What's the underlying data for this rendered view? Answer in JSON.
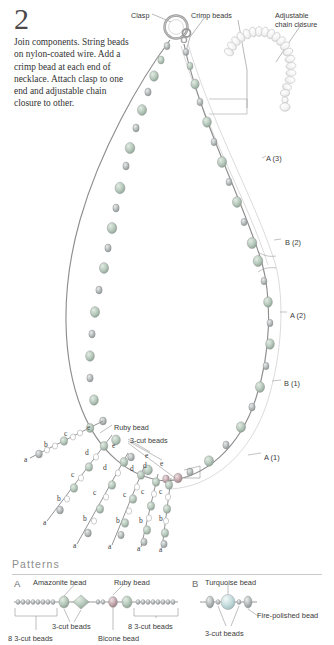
{
  "step": {
    "number": "2",
    "instruction": "Join components. String beads on nylon-coated wire. Add a crimp bead at each end of necklace. Attach clasp to one end and adjustable chain closure to other."
  },
  "diagram": {
    "callouts": [
      {
        "name": "clasp",
        "text": "Clasp",
        "x": 131,
        "y": 11
      },
      {
        "name": "crimp-beads",
        "text": "Crimp beads",
        "x": 191,
        "y": 11
      },
      {
        "name": "adjustable-chain-closure",
        "text": "Adjustable\nchain closure",
        "x": 275,
        "y": 11
      },
      {
        "name": "ruby-bead",
        "text": "Ruby bead",
        "x": 114,
        "y": 423
      },
      {
        "name": "three-cut-beads",
        "text": "3-cut beads",
        "x": 130,
        "y": 436
      }
    ],
    "segment_labels": [
      {
        "name": "segment-a3",
        "text": "A (3)",
        "x": 266,
        "y": 154
      },
      {
        "name": "segment-b2",
        "text": "B (2)",
        "x": 285,
        "y": 238
      },
      {
        "name": "segment-a2",
        "text": "A (2)",
        "x": 290,
        "y": 311
      },
      {
        "name": "segment-b1",
        "text": "B (1)",
        "x": 284,
        "y": 379
      },
      {
        "name": "segment-a1",
        "text": "A (1)",
        "x": 264,
        "y": 453
      }
    ],
    "dangles": [
      {
        "name": "dangle-1",
        "letters": [
          {
            "t": "a",
            "x": 24,
            "y": 455
          },
          {
            "t": "b",
            "x": 44,
            "y": 440
          },
          {
            "t": "c",
            "x": 64,
            "y": 429
          },
          {
            "t": "e",
            "x": 87,
            "y": 423
          }
        ]
      },
      {
        "name": "dangle-2",
        "letters": [
          {
            "t": "a",
            "x": 43,
            "y": 518
          },
          {
            "t": "b",
            "x": 57,
            "y": 494
          },
          {
            "t": "c",
            "x": 71,
            "y": 470
          },
          {
            "t": "d",
            "x": 85,
            "y": 448
          }
        ]
      },
      {
        "name": "dangle-3",
        "letters": [
          {
            "t": "a",
            "x": 73,
            "y": 541
          },
          {
            "t": "b",
            "x": 83,
            "y": 514
          },
          {
            "t": "c",
            "x": 93,
            "y": 488
          },
          {
            "t": "d",
            "x": 103,
            "y": 463
          },
          {
            "t": "e",
            "x": 112,
            "y": 441
          }
        ]
      },
      {
        "name": "dangle-4",
        "letters": [
          {
            "t": "a",
            "x": 108,
            "y": 542
          },
          {
            "t": "b",
            "x": 116,
            "y": 516
          },
          {
            "t": "c",
            "x": 123,
            "y": 490
          },
          {
            "t": "d",
            "x": 130,
            "y": 464
          }
        ]
      },
      {
        "name": "dangle-5",
        "letters": [
          {
            "t": "a",
            "x": 137,
            "y": 544
          },
          {
            "t": "b",
            "x": 139,
            "y": 516
          },
          {
            "t": "c",
            "x": 141,
            "y": 487
          },
          {
            "t": "d",
            "x": 143,
            "y": 461
          },
          {
            "t": "e",
            "x": 145,
            "y": 451
          }
        ]
      },
      {
        "name": "dangle-6",
        "letters": [
          {
            "t": "a",
            "x": 159,
            "y": 545
          },
          {
            "t": "b",
            "x": 159,
            "y": 514
          },
          {
            "t": "c",
            "x": 159,
            "y": 487
          },
          {
            "t": "e",
            "x": 160,
            "y": 459
          }
        ]
      }
    ]
  },
  "patterns": {
    "title": "Patterns",
    "a": {
      "letter": "A",
      "labels": [
        {
          "name": "amazonite-bead",
          "text": "Amazonite bead",
          "x": 33,
          "y": 578
        },
        {
          "name": "ruby-bead",
          "text": "Ruby bead",
          "x": 114,
          "y": 578
        },
        {
          "name": "three-cut-beads-mid",
          "text": "3-cut beads",
          "x": 52,
          "y": 622
        },
        {
          "name": "eight-three-cut-beads-left",
          "text": "8 3-cut beads",
          "x": 8,
          "y": 634
        },
        {
          "name": "bicone-bead",
          "text": "Bicone bead",
          "x": 98,
          "y": 634
        },
        {
          "name": "eight-three-cut-beads-right",
          "text": "8 3-cut beads",
          "x": 128,
          "y": 622
        }
      ]
    },
    "b": {
      "letter": "B",
      "labels": [
        {
          "name": "turquoise-bead",
          "text": "Turquoise bead",
          "x": 205,
          "y": 578
        },
        {
          "name": "fire-polished-bead",
          "text": "Fire-polished bead",
          "x": 257,
          "y": 611
        },
        {
          "name": "three-cut-beads",
          "text": "3-cut beads",
          "x": 205,
          "y": 629
        }
      ]
    }
  },
  "colors": {
    "wire": "#8e8e8e",
    "bead_green": "#a9bdb0",
    "bead_gray": "#9aa0a0",
    "bead_ruby": "#b59aa0",
    "bead_turquoise": "#b9d2d4",
    "leader": "#7a7a7a",
    "text": "#3a3a3a",
    "rule": "#c9c9c9",
    "background": "#ffffff"
  }
}
